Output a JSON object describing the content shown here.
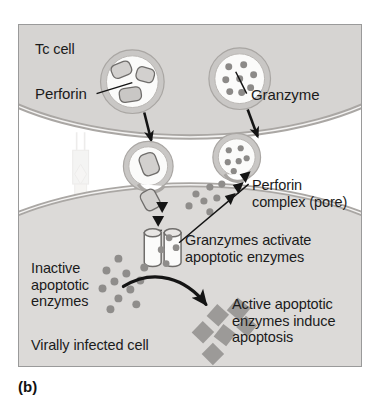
{
  "figure": {
    "caption": "(b)",
    "title_concept": "cytotoxic-t-cell-perforin-granzyme-killing",
    "labels": {
      "tc_cell": "Tc cell",
      "perforin": "Perforin",
      "granzyme": "Granzyme",
      "perforin_complex": "Perforin\ncomplex (pore)",
      "granzymes_activate": "Granzymes activate\napoptotic enzymes",
      "inactive_enzymes": "Inactive\napoptotic\nenzymes",
      "active_enzymes": "Active apoptotic\nenzymes induce\napoptosis",
      "virally_infected_cell": "Virally infected cell"
    },
    "colors": {
      "page_background": "#ffffff",
      "frame_border": "#9a9a9a",
      "cell_cytoplasm": "#d6d4d2",
      "target_cell_cytoplasm": "#dcdad8",
      "membrane_line": "#a9a6a3",
      "vesicle_fill": "#fbfbfa",
      "perforin_granule_fill": "#d2d0ce",
      "granzyme_dot": "#8c8a88",
      "enzyme_dot": "#8f8d8b",
      "active_enzyme_square": "#9c9a98",
      "arrow_black": "#141414",
      "text": "#1b1b1b",
      "ghost_receptor": "#e8e6e4"
    },
    "elements": {
      "tc_cell_vesicles": [
        {
          "name": "perforin-vesicle",
          "granule_count": 3,
          "granule_shape": "rounded-rectangle"
        },
        {
          "name": "granzyme-vesicle",
          "granule_count": 8,
          "granule_shape": "dot"
        },
        {
          "name": "perforin-vesicle-fusing",
          "granule_count": 1,
          "granule_shape": "rounded-rectangle"
        },
        {
          "name": "granzyme-vesicle-fusing",
          "granule_count": 6,
          "granule_shape": "dot"
        }
      ],
      "pore_cylinder_count": 2,
      "released_granzyme_dot_count": 7,
      "inactive_enzyme_dot_count": 11,
      "active_enzyme_square_count": 6
    }
  }
}
